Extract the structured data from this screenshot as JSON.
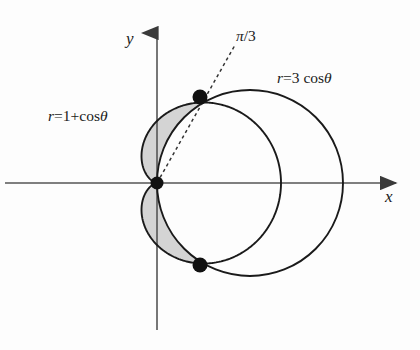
{
  "figure": {
    "background_color": "#fdfdfd",
    "curve_color": "#1a1a1a",
    "axis_color": "#4d4d4d",
    "shade_color": "#d4d4d4",
    "point_color": "#111111"
  },
  "axes": {
    "x_label": "x",
    "y_label": "y",
    "origin_px": {
      "x": 157,
      "y": 183
    },
    "unit_px": 62,
    "x_axis_extent_px": {
      "from": 5,
      "to": 402
    },
    "y_axis_extent_px": {
      "from": 25,
      "to": 330
    }
  },
  "labels": {
    "cardioid": {
      "var": "r",
      "equals": "=",
      "expr": "1+",
      "fn": "cos",
      "theta": "θ",
      "full": "r=1+cos θ"
    },
    "circle": {
      "var": "r",
      "equals": "=",
      "expr": "3",
      "fn": "cos",
      "theta": "θ",
      "full": "r=3 cos θ"
    },
    "ray_angle": {
      "symbol": "π",
      "slash": "/",
      "denominator": "3",
      "full": "π/3"
    }
  },
  "chart_data": {
    "type": "line",
    "title": "",
    "xlabel": "x",
    "ylabel": "y",
    "coordinate_system": "polar",
    "grid": false,
    "legend": "inline-annotations",
    "xlim": [
      -0.6,
      3.9
    ],
    "ylim": [
      -2.4,
      2.5
    ],
    "series": [
      {
        "name": "r=1+cos θ",
        "equation": "r = 1 + cos(θ)",
        "curve": "cardioid",
        "max_r": 2,
        "max_r_at_theta": 0,
        "cusp_at_origin_theta": 3.14159,
        "style": "solid",
        "color": "#1a1a1a"
      },
      {
        "name": "r=3 cos θ",
        "equation": "r = 3 cos(θ)",
        "curve": "circle",
        "diameter": 3,
        "center": [
          1.5,
          0
        ],
        "radius": 1.5,
        "style": "solid",
        "color": "#1a1a1a"
      },
      {
        "name": "θ = π/3 ray",
        "equation": "θ = π/3",
        "curve": "ray",
        "style": "dashed",
        "color": "#333333",
        "from": [
          0,
          0
        ],
        "to_px": [
          235,
          45
        ]
      }
    ],
    "intersection_points": [
      {
        "label": "upper",
        "polar": [
          1.5,
          1.0472
        ],
        "cartesian": [
          0.75,
          1.299
        ],
        "px": [
          200,
          97
        ]
      },
      {
        "label": "pole",
        "polar": [
          0,
          0
        ],
        "cartesian": [
          0,
          0
        ],
        "px": [
          157,
          183
        ]
      },
      {
        "label": "lower",
        "polar": [
          1.5,
          -1.0472
        ],
        "cartesian": [
          0.75,
          -1.299
        ],
        "px": [
          200,
          265
        ]
      }
    ],
    "shaded_region": {
      "description": "Region inside cardioid r=1+cos θ and outside circle r=3 cos θ",
      "fill": "#d4d4d4",
      "bounds_theta": [
        1.0472,
        2.0944
      ]
    },
    "annotations": [
      {
        "text": "r=1+cos θ",
        "px": [
          48,
          108
        ]
      },
      {
        "text": "r=3 cos θ",
        "px": [
          277,
          70
        ]
      },
      {
        "text": "π/3",
        "px": [
          236,
          28
        ]
      },
      {
        "text": "y",
        "px": [
          126,
          30
        ]
      },
      {
        "text": "x",
        "px": [
          385,
          188
        ]
      }
    ]
  }
}
